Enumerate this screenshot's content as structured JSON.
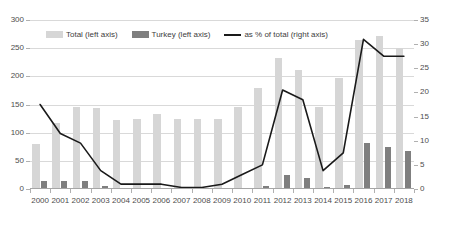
{
  "chart_data": {
    "type": "bar",
    "title": "",
    "subtitle": "",
    "xlabel": "",
    "ylabel": "",
    "categories": [
      "2000",
      "2001",
      "2002",
      "2003",
      "2004",
      "2005",
      "2006",
      "2007",
      "2008",
      "2009",
      "2010",
      "2011",
      "2012",
      "2013",
      "2014",
      "2015",
      "2016",
      "2017",
      "2018"
    ],
    "series": [
      {
        "name": "Total (left axis)",
        "type": "bar",
        "axis": "left",
        "color": "#d6d6d6",
        "values": [
          80,
          118,
          145,
          143,
          122,
          124,
          133,
          125,
          124,
          125,
          145,
          180,
          232,
          212,
          145,
          197,
          265,
          272,
          250
        ]
      },
      {
        "name": "Turkey (left axis)",
        "type": "bar",
        "axis": "left",
        "color": "#7f7f7f",
        "values": [
          15,
          14,
          14,
          5,
          1,
          1,
          1,
          0,
          0,
          1,
          2,
          5,
          25,
          20,
          4,
          8,
          82,
          75,
          68
        ]
      },
      {
        "name": "as % of total (right axis)",
        "type": "line",
        "axis": "right",
        "color": "#1a1a1a",
        "values": [
          17.5,
          11.5,
          9.5,
          3.8,
          1.0,
          1.0,
          1.0,
          0.3,
          0.3,
          1.0,
          3.0,
          5.0,
          20.5,
          18.5,
          3.8,
          7.5,
          31.0,
          27.5,
          27.5
        ]
      }
    ],
    "left_axis": {
      "ticks": [
        "0",
        "50",
        "100",
        "150",
        "200",
        "250",
        "300"
      ],
      "ylim": [
        0,
        300
      ]
    },
    "right_axis": {
      "ticks": [
        "0",
        "5",
        "10",
        "15",
        "20",
        "25",
        "30",
        "35"
      ],
      "ylim": [
        0,
        35
      ]
    },
    "grid": true,
    "legend_position": "top-left-inside"
  },
  "legend": {
    "items": [
      {
        "label": "Total (left axis)",
        "icon": "bar-swatch-light"
      },
      {
        "label": "Turkey (left axis)",
        "icon": "bar-swatch-dark"
      },
      {
        "label": "as % of total (right axis)",
        "icon": "line-swatch-black"
      }
    ]
  }
}
